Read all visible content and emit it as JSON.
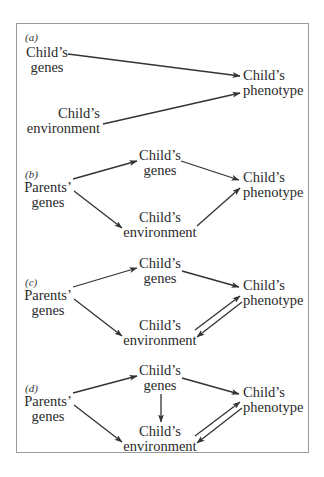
{
  "diagram": {
    "panels": [
      {
        "tag": "(a)",
        "nodes": {
          "child_genes": [
            "Child’s",
            "genes"
          ],
          "child_phenotype": [
            "Child’s",
            "phenotype"
          ],
          "child_environment": [
            "Child’s",
            "environment"
          ]
        },
        "edges": [
          {
            "from": "child_genes",
            "to": "child_phenotype"
          },
          {
            "from": "child_environment",
            "to": "child_phenotype"
          }
        ]
      },
      {
        "tag": "(b)",
        "nodes": {
          "parents_genes": [
            "Parents’",
            "genes"
          ],
          "child_genes": [
            "Child’s",
            "genes"
          ],
          "child_phenotype": [
            "Child’s",
            "phenotype"
          ],
          "child_environment": [
            "Child’s",
            "environment"
          ]
        },
        "edges": [
          {
            "from": "parents_genes",
            "to": "child_genes"
          },
          {
            "from": "parents_genes",
            "to": "child_environment"
          },
          {
            "from": "child_genes",
            "to": "child_phenotype"
          },
          {
            "from": "child_environment",
            "to": "child_phenotype"
          }
        ]
      },
      {
        "tag": "(c)",
        "nodes": {
          "parents_genes": [
            "Parents’",
            "genes"
          ],
          "child_genes": [
            "Child’s",
            "genes"
          ],
          "child_phenotype": [
            "Child’s",
            "phenotype"
          ],
          "child_environment": [
            "Child’s",
            "environment"
          ]
        },
        "edges": [
          {
            "from": "parents_genes",
            "to": "child_genes"
          },
          {
            "from": "parents_genes",
            "to": "child_environment"
          },
          {
            "from": "child_genes",
            "to": "child_phenotype"
          },
          {
            "from": "child_environment",
            "to": "child_phenotype"
          },
          {
            "from": "child_phenotype",
            "to": "child_environment"
          }
        ]
      },
      {
        "tag": "(d)",
        "nodes": {
          "parents_genes": [
            "Parents’",
            "genes"
          ],
          "child_genes": [
            "Child’s",
            "genes"
          ],
          "child_phenotype": [
            "Child’s",
            "phenotype"
          ],
          "child_environment": [
            "Child’s",
            "environment"
          ]
        },
        "edges": [
          {
            "from": "parents_genes",
            "to": "child_genes"
          },
          {
            "from": "parents_genes",
            "to": "child_environment"
          },
          {
            "from": "child_genes",
            "to": "child_phenotype"
          },
          {
            "from": "child_genes",
            "to": "child_environment"
          },
          {
            "from": "child_environment",
            "to": "child_phenotype"
          },
          {
            "from": "child_phenotype",
            "to": "child_environment"
          }
        ]
      }
    ]
  }
}
